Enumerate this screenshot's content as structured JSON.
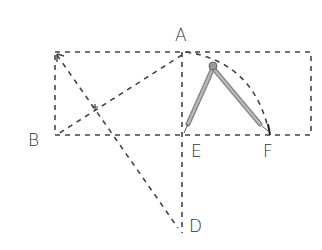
{
  "diagram": {
    "type": "geometry-construction",
    "labels": {
      "A": "A",
      "B": "B",
      "D": "D",
      "E": "E",
      "F": "F"
    },
    "points": {
      "A": [
        182,
        52
      ],
      "B": [
        56,
        135
      ],
      "D": [
        182,
        232
      ],
      "E": [
        182,
        135
      ],
      "F": [
        270,
        135
      ],
      "top_left": [
        55,
        52
      ],
      "top_right": [
        311,
        52
      ],
      "bottom_right": [
        311,
        135
      ],
      "compass_hinge": [
        213,
        66
      ]
    },
    "elements": [
      "dashed rectangle from top-left to bottom-right",
      "dashed vertical line A-E extended to D",
      "dashed diagonal A-B",
      "dashed line from top-left to D",
      "dashed arc from A to F centered at E",
      "compass with legs at E and F"
    ],
    "colors": {
      "line": "#444444",
      "compass": "#888888"
    }
  }
}
